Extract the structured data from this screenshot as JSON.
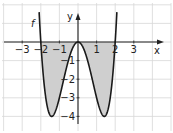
{
  "chart_data": {
    "type": "line",
    "title": "",
    "function_label": "f",
    "function_description": "f(x) = x^4 - 4x^2",
    "xlabel": "x",
    "ylabel": "y",
    "xlim": [
      -3.5,
      4.5
    ],
    "ylim": [
      -4.7,
      2.1
    ],
    "grid": true,
    "x_ticks": [
      "−3",
      "−2",
      "−1",
      "1",
      "2",
      "3"
    ],
    "y_ticks": [
      "−1",
      "−2",
      "−3",
      "−4"
    ],
    "roots": [
      -2,
      0,
      2
    ],
    "minima": [
      {
        "x": -1.414,
        "y": -4
      },
      {
        "x": 1.414,
        "y": -4
      }
    ],
    "local_max": {
      "x": 0,
      "y": 0
    },
    "shaded_region": "area between curve and x-axis for -2 ≤ x ≤ 2",
    "colors": {
      "curve": "#1a1a1a",
      "shade": "#cfcfcf",
      "grid": "#d8d8d8",
      "axis": "#222222"
    }
  }
}
